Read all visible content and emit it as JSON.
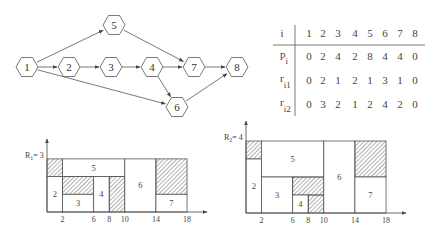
{
  "graph": {
    "nodes": [
      {
        "id": "1",
        "x": 27,
        "y": 67
      },
      {
        "id": "2",
        "x": 69,
        "y": 67
      },
      {
        "id": "3",
        "x": 111,
        "y": 67
      },
      {
        "id": "4",
        "x": 152,
        "y": 67
      },
      {
        "id": "5",
        "x": 114,
        "y": 25
      },
      {
        "id": "6",
        "x": 177,
        "y": 107
      },
      {
        "id": "7",
        "x": 194,
        "y": 67
      },
      {
        "id": "8",
        "x": 237,
        "y": 67
      }
    ],
    "edges": [
      [
        "1",
        "2"
      ],
      [
        "2",
        "3"
      ],
      [
        "3",
        "4"
      ],
      [
        "4",
        "7"
      ],
      [
        "7",
        "8"
      ],
      [
        "1",
        "5"
      ],
      [
        "5",
        "7"
      ],
      [
        "1",
        "6"
      ],
      [
        "4",
        "6"
      ],
      [
        "6",
        "8"
      ]
    ]
  },
  "table": {
    "header_label": "i",
    "columns": [
      "1",
      "2",
      "3",
      "4",
      "5",
      "6",
      "7",
      "8"
    ],
    "rows": [
      {
        "label": "p",
        "sub": "i",
        "values": [
          "0",
          "2",
          "4",
          "2",
          "8",
          "4",
          "4",
          "0"
        ]
      },
      {
        "label": "r",
        "sub": "i1",
        "values": [
          "0",
          "2",
          "1",
          "2",
          "1",
          "3",
          "1",
          "0"
        ]
      },
      {
        "label": "r",
        "sub": "i2",
        "values": [
          "0",
          "3",
          "2",
          "1",
          "2",
          "4",
          "2",
          "0"
        ]
      }
    ]
  },
  "charts": [
    {
      "capacity_label": "R",
      "capacity_sub": "1",
      "capacity_value": "= 3",
      "capacity": 3,
      "origin": {
        "x": 47,
        "y": 212
      },
      "px_per_t": 7.78,
      "px_per_unit": 17.7,
      "ticks": [
        2,
        6,
        8,
        10,
        14,
        18
      ],
      "blocks": [
        {
          "job": "",
          "t0": 0,
          "t1": 2,
          "r0": 2,
          "r1": 3,
          "hatched": true
        },
        {
          "job": "2",
          "t0": 0,
          "t1": 2,
          "r0": 0,
          "r1": 2,
          "hatched": false
        },
        {
          "job": "5",
          "t0": 2,
          "t1": 10,
          "r0": 2,
          "r1": 3,
          "hatched": false
        },
        {
          "job": "",
          "t0": 2,
          "t1": 6,
          "r0": 1,
          "r1": 2,
          "hatched": true
        },
        {
          "job": "3",
          "t0": 2,
          "t1": 6,
          "r0": 0,
          "r1": 1,
          "hatched": false
        },
        {
          "job": "4",
          "t0": 6,
          "t1": 8,
          "r0": 0,
          "r1": 2,
          "hatched": false
        },
        {
          "job": "",
          "t0": 8,
          "t1": 10,
          "r0": 0,
          "r1": 2,
          "hatched": true
        },
        {
          "job": "6",
          "t0": 10,
          "t1": 14,
          "r0": 0,
          "r1": 3,
          "hatched": false
        },
        {
          "job": "",
          "t0": 14,
          "t1": 18,
          "r0": 1,
          "r1": 3,
          "hatched": true
        },
        {
          "job": "7",
          "t0": 14,
          "t1": 18,
          "r0": 0,
          "r1": 1,
          "hatched": false
        }
      ]
    },
    {
      "capacity_label": "R",
      "capacity_sub": "2",
      "capacity_value": "= 4",
      "capacity": 4,
      "origin": {
        "x": 246,
        "y": 213
      },
      "px_per_t": 7.78,
      "px_per_unit": 18,
      "ticks": [
        2,
        6,
        8,
        10,
        14,
        18
      ],
      "blocks": [
        {
          "job": "",
          "t0": 0,
          "t1": 2,
          "r0": 3,
          "r1": 4,
          "hatched": true
        },
        {
          "job": "2",
          "t0": 0,
          "t1": 2,
          "r0": 0,
          "r1": 3,
          "hatched": false
        },
        {
          "job": "5",
          "t0": 2,
          "t1": 10,
          "r0": 2,
          "r1": 4,
          "hatched": false
        },
        {
          "job": "3",
          "t0": 2,
          "t1": 6,
          "r0": 0,
          "r1": 2,
          "hatched": false
        },
        {
          "job": "",
          "t0": 6,
          "t1": 10,
          "r0": 1,
          "r1": 2,
          "hatched": true
        },
        {
          "job": "4",
          "t0": 6,
          "t1": 8,
          "r0": 0,
          "r1": 1,
          "hatched": false
        },
        {
          "job": "",
          "t0": 8,
          "t1": 10,
          "r0": 0,
          "r1": 1,
          "hatched": true
        },
        {
          "job": "6",
          "t0": 10,
          "t1": 14,
          "r0": 0,
          "r1": 4,
          "hatched": false
        },
        {
          "job": "",
          "t0": 14,
          "t1": 18,
          "r0": 2,
          "r1": 4,
          "hatched": true
        },
        {
          "job": "7",
          "t0": 14,
          "t1": 18,
          "r0": 0,
          "r1": 2,
          "hatched": false
        }
      ]
    }
  ],
  "colors": {
    "line": "#555555",
    "text": "#333333",
    "hatch": "#666666",
    "background": "#ffffff"
  }
}
